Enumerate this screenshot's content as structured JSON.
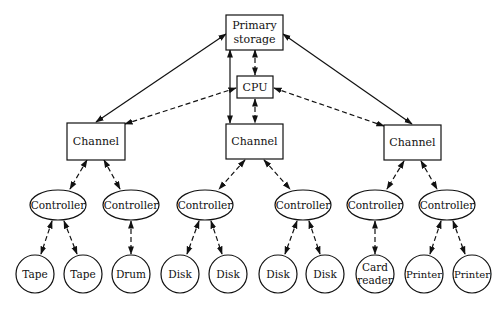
{
  "diagram": {
    "nodes": {
      "primary_storage": {
        "label_line1": "Primary",
        "label_line2": "storage"
      },
      "cpu": {
        "label": "CPU"
      },
      "channels": [
        {
          "label": "Channel"
        },
        {
          "label": "Channel"
        },
        {
          "label": "Channel"
        }
      ],
      "controllers": [
        {
          "label": "Controller"
        },
        {
          "label": "Controller"
        },
        {
          "label": "Controller"
        },
        {
          "label": "Controller"
        },
        {
          "label": "Controller"
        },
        {
          "label": "Controller"
        }
      ],
      "devices": [
        {
          "label": "Tape"
        },
        {
          "label": "Tape"
        },
        {
          "label": "Drum"
        },
        {
          "label": "Disk"
        },
        {
          "label": "Disk"
        },
        {
          "label": "Disk"
        },
        {
          "label": "Disk"
        },
        {
          "label_line1": "Card",
          "label_line2": "reader"
        },
        {
          "label": "Printer"
        },
        {
          "label": "Printer"
        }
      ]
    },
    "edges": [
      {
        "from": "Primary storage",
        "to": "Channel 1",
        "style": "solid",
        "arrows": "both"
      },
      {
        "from": "Primary storage",
        "to": "Channel 2",
        "style": "solid",
        "arrows": "both"
      },
      {
        "from": "Primary storage",
        "to": "Channel 3",
        "style": "solid",
        "arrows": "both"
      },
      {
        "from": "Primary storage",
        "to": "CPU",
        "style": "dashed",
        "arrows": "both"
      },
      {
        "from": "CPU",
        "to": "Channel 1",
        "style": "dashed",
        "arrows": "both"
      },
      {
        "from": "CPU",
        "to": "Channel 2",
        "style": "dashed",
        "arrows": "both"
      },
      {
        "from": "CPU",
        "to": "Channel 3",
        "style": "dashed",
        "arrows": "both"
      },
      {
        "from": "Channel 1",
        "to": "Controller 1",
        "style": "dashed",
        "arrows": "both"
      },
      {
        "from": "Channel 1",
        "to": "Controller 2",
        "style": "dashed",
        "arrows": "both"
      },
      {
        "from": "Channel 2",
        "to": "Controller 3",
        "style": "dashed",
        "arrows": "both"
      },
      {
        "from": "Channel 2",
        "to": "Controller 4",
        "style": "dashed",
        "arrows": "both"
      },
      {
        "from": "Channel 3",
        "to": "Controller 5",
        "style": "dashed",
        "arrows": "both"
      },
      {
        "from": "Channel 3",
        "to": "Controller 6",
        "style": "dashed",
        "arrows": "both"
      },
      {
        "from": "Controller 1",
        "to": "Tape",
        "style": "dashed",
        "arrows": "both"
      },
      {
        "from": "Controller 1",
        "to": "Tape",
        "style": "dashed",
        "arrows": "both"
      },
      {
        "from": "Controller 2",
        "to": "Drum",
        "style": "dashed",
        "arrows": "both"
      },
      {
        "from": "Controller 3",
        "to": "Disk",
        "style": "dashed",
        "arrows": "both"
      },
      {
        "from": "Controller 3",
        "to": "Disk",
        "style": "dashed",
        "arrows": "both"
      },
      {
        "from": "Controller 4",
        "to": "Disk",
        "style": "dashed",
        "arrows": "both"
      },
      {
        "from": "Controller 4",
        "to": "Disk",
        "style": "dashed",
        "arrows": "both"
      },
      {
        "from": "Controller 5",
        "to": "Card reader",
        "style": "dashed",
        "arrows": "both"
      },
      {
        "from": "Controller 6",
        "to": "Printer",
        "style": "dashed",
        "arrows": "both"
      },
      {
        "from": "Controller 6",
        "to": "Printer",
        "style": "dashed",
        "arrows": "both"
      }
    ],
    "colors": {
      "stroke": "#111111",
      "background": "#ffffff"
    }
  }
}
